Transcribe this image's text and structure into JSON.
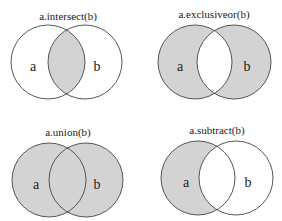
{
  "colors": {
    "fill": "#d3d3d3",
    "stroke": "#444444",
    "background": "#ffffff"
  },
  "panels": [
    {
      "id": "intersect",
      "title": "a.intersect(b)",
      "label_a": "a",
      "label_b": "b",
      "cy": 62,
      "ax": 48,
      "bx": 85,
      "r": 37,
      "title_x": 68,
      "title_y": 20,
      "shaded": "intersection"
    },
    {
      "id": "exclusiveor",
      "title": "a.exclusiveor(b)",
      "label_a": "a",
      "label_b": "b",
      "cy": 62,
      "ax": 195,
      "bx": 234,
      "r": 37,
      "title_x": 214,
      "title_y": 18,
      "shaded": "symmetric-difference"
    },
    {
      "id": "union",
      "title": "a.union(b)",
      "label_a": "a",
      "label_b": "b",
      "cy": 180,
      "ax": 49,
      "bx": 86,
      "r": 37,
      "title_x": 68,
      "title_y": 136,
      "shaded": "union"
    },
    {
      "id": "subtract",
      "title": "a.subtract(b)",
      "label_a": "a",
      "label_b": "b",
      "cy": 178,
      "ax": 198,
      "bx": 236,
      "r": 37,
      "title_x": 217,
      "title_y": 134,
      "shaded": "a-minus-b"
    }
  ]
}
